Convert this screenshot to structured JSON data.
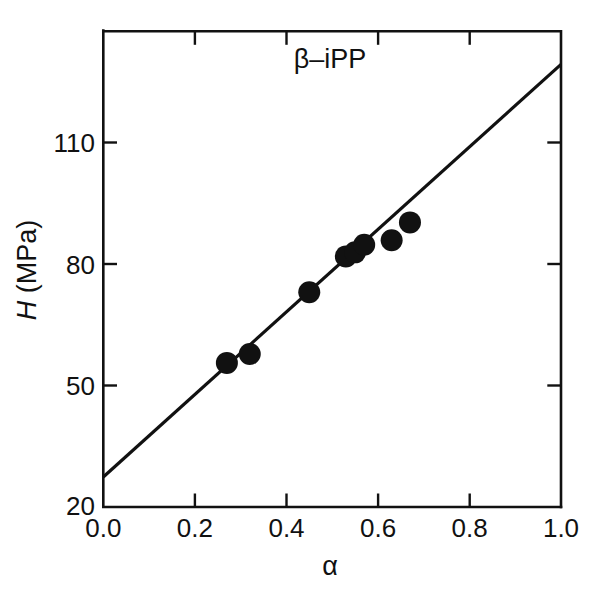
{
  "figure": {
    "annotation": "β–iPP",
    "background_color": "#ffffff",
    "foreground_color": "#111111"
  },
  "axes": {
    "x_label": "α",
    "y_label_prefix": "H",
    "y_label_suffix": " (MPa)",
    "x_tick_labels": [
      "0.0",
      "0.2",
      "0.4",
      "0.6",
      "0.8",
      "1.0"
    ],
    "y_tick_labels": [
      "20",
      "50",
      "80",
      "110"
    ]
  },
  "chart_data": {
    "type": "scatter",
    "title": "β–iPP",
    "xlabel": "α",
    "ylabel": "H (MPa)",
    "xlim": [
      0.0,
      1.0
    ],
    "ylim": [
      20,
      126.3
    ],
    "xticks": [
      0.0,
      0.2,
      0.4,
      0.6,
      0.8,
      1.0
    ],
    "yticks": [
      20,
      50,
      80,
      110
    ],
    "grid": false,
    "legend": "none",
    "marker": "filled-circle",
    "marker_color": "#111111",
    "x": [
      0.27,
      0.32,
      0.45,
      0.53,
      0.55,
      0.57,
      0.63,
      0.67
    ],
    "y": [
      52.2,
      54.2,
      68.0,
      76.0,
      76.9,
      78.6,
      79.6,
      83.6
    ],
    "points": [
      {
        "alpha": 0.27,
        "H": 52.2
      },
      {
        "alpha": 0.32,
        "H": 54.2
      },
      {
        "alpha": 0.45,
        "H": 68.0
      },
      {
        "alpha": 0.53,
        "H": 76.0
      },
      {
        "alpha": 0.55,
        "H": 76.9
      },
      {
        "alpha": 0.57,
        "H": 78.6
      },
      {
        "alpha": 0.63,
        "H": 79.6
      },
      {
        "alpha": 0.67,
        "H": 83.6
      }
    ],
    "series": [
      {
        "name": "β-iPP microhardness data",
        "type": "scatter",
        "x": [
          0.27,
          0.32,
          0.45,
          0.53,
          0.55,
          0.57,
          0.63,
          0.67
        ],
        "values": [
          52.2,
          54.2,
          68.0,
          76.0,
          76.9,
          78.6,
          79.6,
          83.6
        ]
      },
      {
        "name": "linear fit",
        "type": "line",
        "x": [
          0.0,
          1.0
        ],
        "values": [
          26.7,
          118.9
        ],
        "slope": 92.2,
        "intercept": 26.7
      }
    ]
  }
}
